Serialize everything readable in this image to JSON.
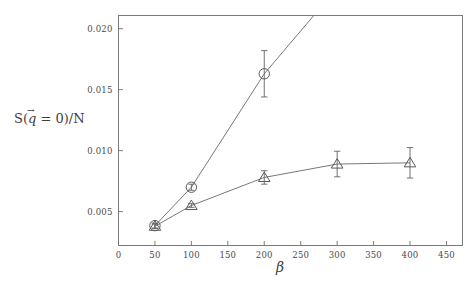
{
  "figure": {
    "background_color": "#ffffff",
    "axis_color": "#6e6e6e",
    "curve_color": "#707070",
    "marker_color": "#5a5a5a",
    "text_color": "#3d3d3d"
  },
  "axes": {
    "x_label": "β",
    "y_label_parts": {
      "prefix": "S(",
      "symbol": "q",
      "arrow": "→",
      "middle": " = 0)/N"
    },
    "y_label_plain": "S(q⃗ = 0)/N",
    "x_ticks": [
      "0",
      "50",
      "100",
      "150",
      "200",
      "250",
      "300",
      "350",
      "400",
      "450"
    ],
    "x_tick_values": [
      0,
      50,
      100,
      150,
      200,
      250,
      300,
      350,
      400,
      450
    ],
    "y_ticks": [
      "0.005",
      "0.010",
      "0.015",
      "0.020"
    ],
    "y_tick_values": [
      0.005,
      0.01,
      0.015,
      0.02
    ],
    "xlim": [
      0,
      472
    ],
    "ylim": [
      0.00222,
      0.02108
    ],
    "grid": false,
    "frame": "box"
  },
  "chart_data": {
    "type": "scatter",
    "title": "",
    "xlabel": "β",
    "ylabel": "S(q⃗ = 0)/N",
    "xlim": [
      0,
      472
    ],
    "ylim": [
      0.00222,
      0.02108
    ],
    "grid": false,
    "legend": "none",
    "series": [
      {
        "name": "circles",
        "marker": "circle",
        "x": [
          50,
          100,
          200
        ],
        "values": [
          0.00385,
          0.007,
          0.0163
        ],
        "yerr": [
          0.0002,
          0.00025,
          0.0019
        ],
        "extrapolated_to": {
          "x": 268,
          "y": 0.02108
        },
        "note": "line rises steeply and exits top of frame"
      },
      {
        "name": "triangles",
        "marker": "triangle-up",
        "x": [
          50,
          100,
          200,
          300,
          400
        ],
        "values": [
          0.0038,
          0.0055,
          0.0078,
          0.0089,
          0.009
        ],
        "yerr": [
          0.00018,
          0.00015,
          0.00055,
          0.00105,
          0.00125
        ]
      }
    ]
  }
}
